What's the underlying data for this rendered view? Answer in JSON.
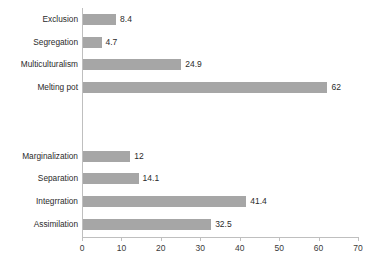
{
  "chart_data": {
    "type": "bar",
    "orientation": "horizontal",
    "title": "",
    "subtitle": "",
    "xlabel": "",
    "ylabel": "",
    "xlim": [
      0,
      70
    ],
    "xticks": [
      0,
      10,
      20,
      30,
      40,
      50,
      60,
      70
    ],
    "xtick_labels": [
      "0",
      "10",
      "20",
      "30",
      "40",
      "50",
      "60",
      "70"
    ],
    "grid": false,
    "legend": false,
    "legend_position": "none",
    "bar_color": "#a6a6a6",
    "axis_color": "#bfbfbf",
    "text_color": "#2b2b2b",
    "groups": [
      {
        "name": "group-upper",
        "categories": [
          "Exclusion",
          "Segregation",
          "Multiculturalism",
          "Melting pot"
        ],
        "values": [
          8.4,
          4.7,
          24.9,
          62
        ],
        "value_labels": [
          "8.4",
          "4.7",
          "24.9",
          "62"
        ]
      },
      {
        "name": "group-lower",
        "categories": [
          "Marginalization",
          "Separation",
          "Integrration",
          "Assimilation"
        ],
        "values": [
          12,
          14.1,
          41.4,
          32.5
        ],
        "value_labels": [
          "12",
          "14.1",
          "41.4",
          "32.5"
        ]
      }
    ],
    "categories": [
      "Exclusion",
      "Segregation",
      "Multiculturalism",
      "Melting pot",
      "Marginalization",
      "Separation",
      "Integrration",
      "Assimilation"
    ],
    "values": [
      8.4,
      4.7,
      24.9,
      62,
      12,
      14.1,
      41.4,
      32.5
    ]
  },
  "bars": [
    {
      "category": "Exclusion",
      "value": 8.4,
      "label": "8.4",
      "top": 13
    },
    {
      "category": "Segregation",
      "value": 4.7,
      "label": "4.7",
      "top": 36
    },
    {
      "category": "Multiculturalism",
      "value": 24.9,
      "label": "24.9",
      "top": 58
    },
    {
      "category": "Melting pot",
      "value": 62,
      "label": "62",
      "top": 81
    },
    {
      "category": "Marginalization",
      "value": 12,
      "label": "12",
      "top": 150
    },
    {
      "category": "Separation",
      "value": 14.1,
      "label": "14.1",
      "top": 172
    },
    {
      "category": "Integrration",
      "value": 41.4,
      "label": "41.4",
      "top": 195
    },
    {
      "category": "Assimilation",
      "value": 32.5,
      "label": "32.5",
      "top": 218
    }
  ],
  "axis": {
    "ticks": [
      {
        "value": 0,
        "label": "0"
      },
      {
        "value": 10,
        "label": "10"
      },
      {
        "value": 20,
        "label": "20"
      },
      {
        "value": 30,
        "label": "30"
      },
      {
        "value": 40,
        "label": "40"
      },
      {
        "value": 50,
        "label": "50"
      },
      {
        "value": 60,
        "label": "60"
      },
      {
        "value": 70,
        "label": "70"
      }
    ]
  }
}
